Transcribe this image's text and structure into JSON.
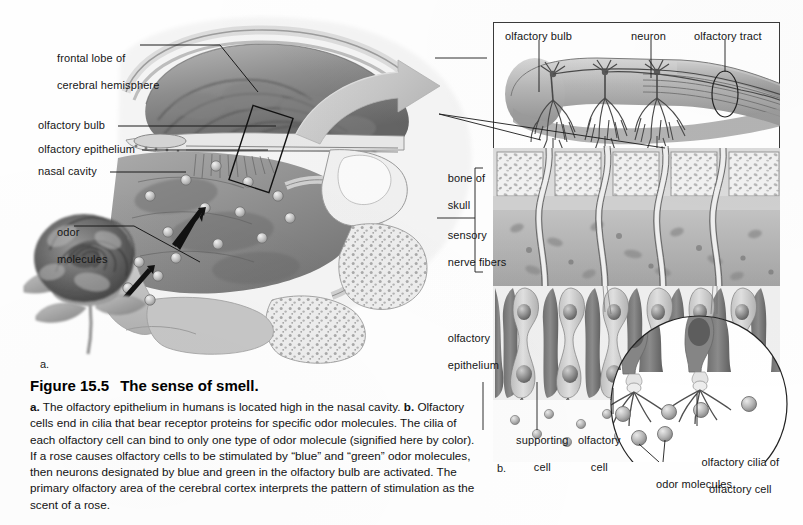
{
  "figure": {
    "number": "Figure 15.5",
    "title": "The sense of smell.",
    "caption_parts": {
      "a_marker": "a.",
      "a_text": " The olfactory epithelium in humans is located high in the nasal cavity. ",
      "b_marker": "b.",
      "b_text": " Olfactory cells end in cilia that bear receptor proteins for specific odor molecules. The cilia of each olfactory cell can bind to only one type of odor molecule (signified here by color). If a rose causes olfactory cells to be stimulated by “blue” and “green” odor molecules, then neurons designated by blue and green in the olfactory bulb are activated. The primary olfactory area of the cerebral cortex interprets the pattern of stimulation as the scent of a rose."
    }
  },
  "panel_a": {
    "marker": "a.",
    "labels": [
      {
        "id": "frontal-lobe",
        "line1": "frontal lobe of",
        "line2": "cerebral hemisphere"
      },
      {
        "id": "olfactory-bulb",
        "line1": "olfactory bulb",
        "line2": ""
      },
      {
        "id": "olfactory-epithelium",
        "line1": "olfactory epithelium",
        "line2": ""
      },
      {
        "id": "nasal-cavity",
        "line1": "nasal cavity",
        "line2": ""
      },
      {
        "id": "odor-molecules",
        "line1": "odor",
        "line2": "molecules"
      }
    ]
  },
  "panel_b": {
    "marker": "b.",
    "labels": [
      {
        "id": "olfactory-bulb",
        "line1": "olfactory bulb",
        "line2": ""
      },
      {
        "id": "neuron",
        "line1": "neuron",
        "line2": ""
      },
      {
        "id": "olfactory-tract",
        "line1": "olfactory tract",
        "line2": ""
      },
      {
        "id": "bone-of-skull",
        "line1": "bone of",
        "line2": "skull"
      },
      {
        "id": "sensory-nerve-fibers",
        "line1": "sensory",
        "line2": "nerve fibers"
      },
      {
        "id": "olfactory-epithelium",
        "line1": "olfactory",
        "line2": "epithelium"
      },
      {
        "id": "supporting-cell",
        "line1": "supporting",
        "line2": "cell"
      },
      {
        "id": "olfactory-cell",
        "line1": "olfactory",
        "line2": "cell"
      },
      {
        "id": "olfactory-cilia",
        "line1": "olfactory cilia of",
        "line2": "olfactory cell"
      },
      {
        "id": "odor-molecules",
        "line1": "odor molecules",
        "line2": ""
      }
    ]
  },
  "colors": {
    "ink": "#161616",
    "leader": "#1a1a1a",
    "page": "#ffffff",
    "tissue_mid": "#9a9a9a",
    "tissue_dark": "#6d6d6d",
    "tissue_light": "#c9c9c9",
    "bone_fill": "#efefef",
    "arrow_gray": "#c4c4c4",
    "panel_border": "#3a3a3a"
  }
}
